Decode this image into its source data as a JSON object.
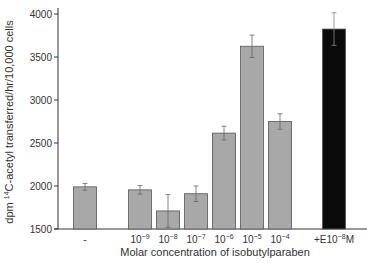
{
  "chart_data": {
    "type": "bar",
    "title": "",
    "xlabel": "Molar concentration of isobutylparaben",
    "ylabel_parts": {
      "pre": "dpm ",
      "sup": "14",
      "post": "C-acetyl transferred/hr/10,000 cells"
    },
    "ylabel": "dpm 14C-acetyl transferred/hr/10,000 cells",
    "ylim": [
      1500,
      4000
    ],
    "yticks": [
      1500,
      2000,
      2500,
      3000,
      3500,
      4000
    ],
    "grid": false,
    "categories": [
      {
        "base": "-",
        "exp": ""
      },
      {
        "base": "10",
        "exp": "−9"
      },
      {
        "base": "10",
        "exp": "−8"
      },
      {
        "base": "10",
        "exp": "−7"
      },
      {
        "base": "10",
        "exp": "−6"
      },
      {
        "base": "10",
        "exp": "−5"
      },
      {
        "base": "10",
        "exp": "−4"
      },
      {
        "base": "+E10",
        "exp": "−8",
        "suffix": "M"
      }
    ],
    "values": [
      1990,
      1955,
      1710,
      1910,
      2615,
      3625,
      2750,
      3825
    ],
    "errors": [
      40,
      50,
      190,
      90,
      80,
      130,
      90,
      190
    ],
    "bar_colors": [
      "#a8a8a8",
      "#a8a8a8",
      "#a8a8a8",
      "#a8a8a8",
      "#a8a8a8",
      "#a8a8a8",
      "#a8a8a8",
      "#0a0a0a"
    ]
  }
}
